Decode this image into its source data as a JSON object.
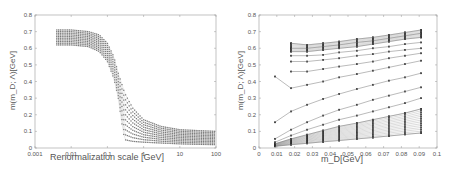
{
  "chart_data": [
    {
      "type": "scatter",
      "panel": "left",
      "title": "",
      "xlabel": "Renormalization scale [GeV]",
      "ylabel": "m(m_D; Λ)[GeV]",
      "xscale": "log",
      "xlim": [
        0.001,
        100
      ],
      "ylim": [
        0,
        0.8
      ],
      "xticks": [
        "0.001",
        "0.01",
        "0.1",
        "1",
        "10",
        "100"
      ],
      "yticks": [
        "0",
        "0.1",
        "0.2",
        "0.3",
        "0.4",
        "0.5",
        "0.6",
        "0.7",
        "0.8"
      ],
      "grid": false,
      "legend": null,
      "description": "Band of running-mass curves vs renormalization scale; plateau 0.62–0.71 GeV at low scale, steep drop around 0.1–0.3 GeV, tail 0.02–0.10 GeV at 100 GeV",
      "series": [
        {
          "name": "upper envelope",
          "x": [
            0.004,
            0.01,
            0.03,
            0.06,
            0.1,
            0.15,
            0.2,
            0.3,
            0.5,
            1,
            3,
            10,
            30,
            100
          ],
          "y": [
            0.71,
            0.71,
            0.7,
            0.68,
            0.63,
            0.55,
            0.45,
            0.33,
            0.24,
            0.17,
            0.13,
            0.11,
            0.105,
            0.1
          ]
        },
        {
          "name": "lower envelope",
          "x": [
            0.004,
            0.01,
            0.03,
            0.06,
            0.1,
            0.15,
            0.2,
            0.25,
            0.3,
            0.5,
            1,
            3,
            10,
            30,
            100
          ],
          "y": [
            0.62,
            0.62,
            0.61,
            0.58,
            0.52,
            0.42,
            0.3,
            0.15,
            0.05,
            0.04,
            0.035,
            0.03,
            0.025,
            0.022,
            0.02
          ]
        }
      ]
    },
    {
      "type": "line",
      "panel": "right",
      "title": "",
      "xlabel": "m_D[GeV]",
      "ylabel": "m(m_D; Λ)[GeV]",
      "xlim": [
        0,
        0.1
      ],
      "ylim": [
        0,
        0.8
      ],
      "xticks": [
        "0",
        "0.01",
        "0.02",
        "0.03",
        "0.04",
        "0.05",
        "0.06",
        "0.07",
        "0.08",
        "0.09",
        "0.1"
      ],
      "yticks": [
        "0",
        "0.1",
        "0.2",
        "0.3",
        "0.4",
        "0.5",
        "0.6",
        "0.7",
        "0.8"
      ],
      "grid": false,
      "legend": null,
      "x": [
        0.009,
        0.018,
        0.027,
        0.036,
        0.045,
        0.055,
        0.064,
        0.073,
        0.082,
        0.091
      ],
      "series": [
        {
          "name": "top",
          "values": [
            null,
            0.63,
            0.62,
            0.63,
            0.64,
            0.655,
            0.665,
            0.68,
            0.695,
            0.71
          ]
        },
        {
          "name": "s2",
          "values": [
            null,
            0.6,
            0.6,
            0.61,
            0.62,
            0.635,
            0.645,
            0.66,
            0.675,
            0.69
          ]
        },
        {
          "name": "s3",
          "values": [
            null,
            0.58,
            0.58,
            0.59,
            0.6,
            0.61,
            0.625,
            0.64,
            0.655,
            0.665
          ]
        },
        {
          "name": "s4",
          "values": [
            null,
            0.555,
            0.555,
            0.56,
            0.575,
            0.585,
            0.6,
            0.61,
            0.625,
            0.635
          ]
        },
        {
          "name": "s5",
          "values": [
            null,
            0.52,
            0.52,
            0.53,
            0.54,
            0.555,
            0.565,
            0.58,
            0.59,
            0.6
          ]
        },
        {
          "name": "s6",
          "values": [
            null,
            0.46,
            0.46,
            0.475,
            0.49,
            0.505,
            0.52,
            0.54,
            0.555,
            0.57
          ]
        },
        {
          "name": "s7",
          "values": [
            0.43,
            0.36,
            0.38,
            0.4,
            0.425,
            0.445,
            0.465,
            0.485,
            0.505,
            0.525
          ]
        },
        {
          "name": "s8",
          "values": [
            0.155,
            0.22,
            0.26,
            0.295,
            0.325,
            0.355,
            0.38,
            0.405,
            0.425,
            0.45
          ]
        },
        {
          "name": "s9",
          "values": [
            0.055,
            0.11,
            0.155,
            0.195,
            0.23,
            0.26,
            0.29,
            0.315,
            0.34,
            0.365
          ]
        },
        {
          "name": "s10",
          "values": [
            0.035,
            0.075,
            0.11,
            0.14,
            0.17,
            0.195,
            0.22,
            0.245,
            0.27,
            0.3
          ]
        },
        {
          "name": "s11",
          "values": [
            0.025,
            0.055,
            0.08,
            0.105,
            0.13,
            0.15,
            0.17,
            0.19,
            0.21,
            0.235
          ]
        },
        {
          "name": "bottom",
          "values": [
            0.01,
            0.02,
            0.028,
            0.037,
            0.045,
            0.055,
            0.063,
            0.072,
            0.082,
            0.09
          ]
        }
      ]
    }
  ],
  "left": {
    "xlabel": "Renormalization scale [GeV]",
    "ylabel": "m(m_D; Λ)[GeV]"
  },
  "right": {
    "xlabel": "m_D[GeV]",
    "ylabel": "m(m_D; Λ)[GeV]"
  }
}
